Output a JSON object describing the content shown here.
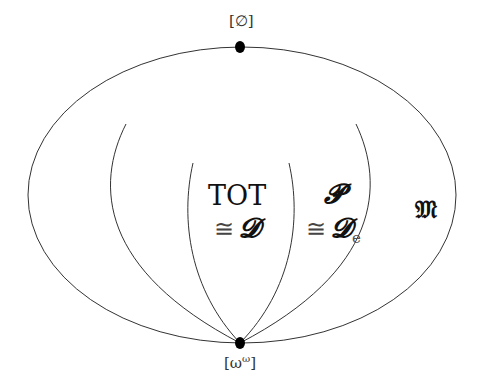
{
  "diagram": {
    "type": "set-inclusion diagram of degree structures",
    "top_point": {
      "label": "[∅]",
      "x": 240,
      "y": 47
    },
    "bottom_point": {
      "label": "[ω^ω]",
      "base": "ω",
      "exp": "ω",
      "x": 240,
      "y": 343
    },
    "regions": [
      {
        "id": "tot",
        "line1": "TOT",
        "line2_cong": "≅",
        "line2_sym": "𝓓"
      },
      {
        "id": "p",
        "line1": "𝓟",
        "line2_cong": "≅",
        "line2_sym": "𝓓",
        "line2_sub": "e"
      },
      {
        "id": "m",
        "label": "𝔐"
      }
    ],
    "colors": {
      "line": "#333333",
      "point": "#000000",
      "background": "#ffffff"
    }
  }
}
